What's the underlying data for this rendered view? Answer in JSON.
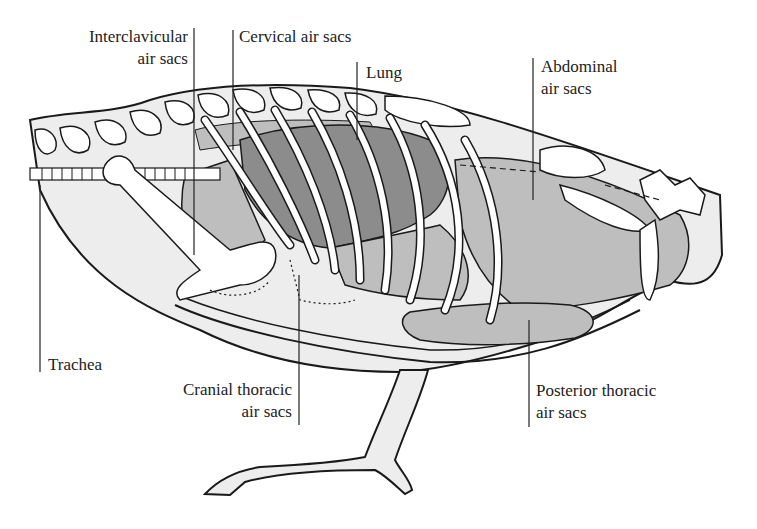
{
  "figure": {
    "colors": {
      "lung": "#8c8c8c",
      "air_sac": "#bebebe",
      "body_fill": "#ededed",
      "bone": "#ffffff",
      "outline": "#1a1a1a",
      "label_text": "#222222"
    }
  },
  "labels": {
    "interclavicular": {
      "line1": "Interclavicular",
      "line2": "air sacs"
    },
    "cervical": {
      "line1": "Cervical air sacs"
    },
    "lung": {
      "line1": "Lung"
    },
    "abdominal": {
      "line1": "Abdominal",
      "line2": "air sacs"
    },
    "trachea": {
      "line1": "Trachea"
    },
    "cranial_thoracic": {
      "line1": "Cranial thoracic",
      "line2": "air sacs"
    },
    "posterior_thoracic": {
      "line1": "Posterior thoracic",
      "line2": "air sacs"
    }
  }
}
